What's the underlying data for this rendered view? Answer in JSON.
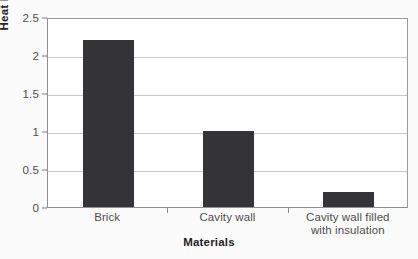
{
  "chart_data": {
    "type": "bar",
    "title": "",
    "xlabel": "Materials",
    "ylabel": "Heat loss",
    "categories": [
      "Brick",
      "Cavity wall",
      "Cavity wall filled with insulation"
    ],
    "category_lines": [
      [
        "Brick"
      ],
      [
        "Cavity wall"
      ],
      [
        "Cavity wall filled",
        "with insulation"
      ]
    ],
    "values": [
      2.2,
      1.0,
      0.2
    ],
    "ylim": [
      0,
      2.5
    ],
    "ytick_labels": [
      "0",
      "0.5",
      "1",
      "1.5",
      "2",
      "2.5"
    ],
    "ytick_values": [
      0,
      0.5,
      1,
      1.5,
      2,
      2.5
    ],
    "grid": true,
    "legend": "none",
    "bar_color": "#343436",
    "gridline_color": "#c9c9c9",
    "axis_color": "#8e8e8e",
    "background_color": "#fbfbfb",
    "plot_background_color": "#ffffff",
    "text_color": "#4d4d4d",
    "title_color": "#232323"
  }
}
